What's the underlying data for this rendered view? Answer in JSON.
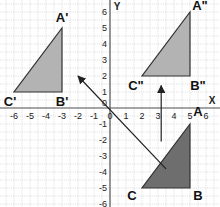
{
  "diagram": {
    "type": "coordinate-plane-transformations",
    "axes": {
      "x_label": "X",
      "y_label": "Y",
      "x_range": [
        -6,
        6
      ],
      "y_range": [
        -6,
        6
      ],
      "x_ticks": [
        "-6",
        "-5",
        "-4",
        "-3",
        "-2",
        "-1",
        "0",
        "1",
        "2",
        "3",
        "4",
        "5",
        "6"
      ],
      "y_ticks": [
        "6",
        "5",
        "4",
        "3",
        "2",
        "1",
        "-1",
        "-2",
        "-3",
        "-4",
        "-5",
        "-6"
      ],
      "origin_label": "0"
    },
    "triangles": [
      {
        "name": "original",
        "fill": "#6e6e6e",
        "vertices": [
          {
            "label": "A",
            "x": 5,
            "y": -1
          },
          {
            "label": "B",
            "x": 5,
            "y": -5
          },
          {
            "label": "C",
            "x": 2,
            "y": -5
          }
        ]
      },
      {
        "name": "image-prime",
        "fill": "#b3b3b3",
        "vertices": [
          {
            "label": "A'",
            "x": -3,
            "y": 5
          },
          {
            "label": "B'",
            "x": -3,
            "y": 1
          },
          {
            "label": "C'",
            "x": -6,
            "y": 1
          }
        ]
      },
      {
        "name": "image-double-prime",
        "fill": "#b3b3b3",
        "vertices": [
          {
            "label": "A\"",
            "x": 5,
            "y": 6
          },
          {
            "label": "B\"",
            "x": 5,
            "y": 2
          },
          {
            "label": "C\"",
            "x": 2,
            "y": 2
          }
        ]
      }
    ],
    "arrows": [
      {
        "name": "translation-to-prime",
        "from": [
          3.5,
          -3.8
        ],
        "to": [
          -2,
          2
        ]
      },
      {
        "name": "translation-to-double-prime",
        "from": [
          3.2,
          -2.1
        ],
        "to": [
          3.2,
          1.4
        ]
      }
    ]
  }
}
